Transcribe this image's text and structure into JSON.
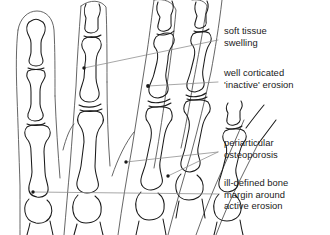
{
  "figure": {
    "background_color": "#ffffff",
    "bone_outline_color": "#1a1a1a",
    "soft_tissue_outline_color": "#4a4a4a",
    "leader_line_color": "#8a8a8a",
    "marker_color": "#1a1a1a",
    "text_color": "#1a1a1a"
  },
  "annotations": [
    {
      "id": "soft-tissue-swelling",
      "lines": [
        "soft tissue",
        "swelling"
      ],
      "line1": "soft tissue",
      "line2": "swelling",
      "text_x": 224,
      "text_y": 34,
      "marker_x": 84,
      "marker_y": 68
    },
    {
      "id": "well-corticated-inactive-erosion",
      "lines": [
        "well corticated",
        "'inactive' erosion"
      ],
      "line1": "well corticated",
      "line2": "'inactive' erosion",
      "text_x": 224,
      "text_y": 76,
      "marker_x": 148,
      "marker_y": 86
    },
    {
      "id": "periarticular-osteoporosis",
      "lines": [
        "periarticular",
        "osteoporosis"
      ],
      "line1": "periarticular",
      "line2": "osteoporosis",
      "text_x": 224,
      "text_y": 146,
      "marker_x": 126,
      "marker_y": 162,
      "marker2_x": 168,
      "marker2_y": 176
    },
    {
      "id": "ill-defined-bone-margin",
      "lines": [
        "ill-defined bone",
        "margin around",
        "active erosion"
      ],
      "line1": "ill-defined bone",
      "line2": "margin around",
      "line3": "active erosion",
      "text_x": 224,
      "text_y": 186,
      "marker_x": 33,
      "marker_y": 192
    }
  ]
}
